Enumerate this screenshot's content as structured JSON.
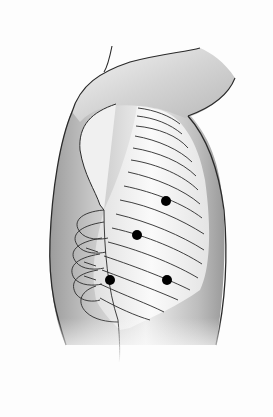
{
  "figure": {
    "colors": {
      "background": "#fdfdfd",
      "skin_dark": "#a8a8a8",
      "skin_mid": "#cfcfcf",
      "skin_light": "#f2f2f2",
      "outline": "#2a2a2a",
      "marker": "#000000"
    },
    "markers": [
      {
        "id": "marker-1",
        "cx": 166,
        "cy": 201
      },
      {
        "id": "marker-2",
        "cx": 137,
        "cy": 235
      },
      {
        "id": "marker-3",
        "cx": 110,
        "cy": 280
      },
      {
        "id": "marker-4",
        "cx": 167,
        "cy": 280
      }
    ]
  }
}
